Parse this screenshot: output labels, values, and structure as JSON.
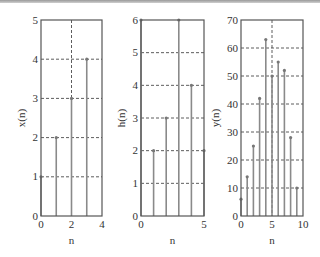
{
  "chart_data": [
    {
      "type": "stem",
      "xlabel": "n",
      "ylabel": "x(n)",
      "xlim": [
        0,
        4
      ],
      "ylim": [
        0,
        5
      ],
      "xticks": [
        0,
        2,
        4
      ],
      "yticks": [
        0,
        1,
        2,
        3,
        4,
        5
      ],
      "grid": true,
      "x": [
        0,
        1,
        2,
        3
      ],
      "values": [
        1,
        2,
        3,
        4
      ]
    },
    {
      "type": "stem",
      "xlabel": "n",
      "ylabel": "h(n)",
      "xlim": [
        0,
        5
      ],
      "ylim": [
        0,
        6
      ],
      "xticks": [
        0,
        5
      ],
      "yticks": [
        0,
        1,
        2,
        3,
        4,
        5,
        6
      ],
      "grid": true,
      "x": [
        0,
        1,
        2,
        3,
        4,
        5
      ],
      "values": [
        6,
        2,
        3,
        6,
        4,
        2
      ]
    },
    {
      "type": "stem",
      "xlabel": "n",
      "ylabel": "y(n)",
      "xlim": [
        0,
        10
      ],
      "ylim": [
        0,
        70
      ],
      "xticks": [
        0,
        5,
        10
      ],
      "yticks": [
        0,
        10,
        20,
        30,
        40,
        50,
        60,
        70
      ],
      "grid": true,
      "x": [
        0,
        1,
        2,
        3,
        4,
        5,
        6,
        7,
        8,
        9
      ],
      "values": [
        6,
        14,
        25,
        42,
        63,
        50,
        55,
        52,
        28,
        10
      ]
    }
  ]
}
